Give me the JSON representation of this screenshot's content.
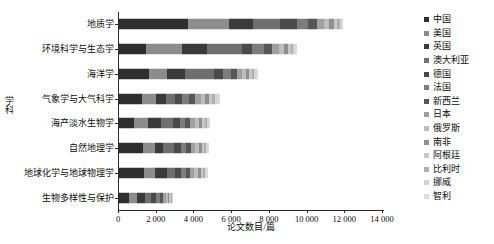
{
  "chart_data": {
    "type": "bar",
    "orientation": "horizontal",
    "stacked": true,
    "title": "",
    "xlabel": "论文数目/篇",
    "ylabel": "学科",
    "xlim": [
      0,
      14000
    ],
    "xticks": [
      0,
      2000,
      4000,
      6000,
      8000,
      10000,
      12000,
      14000
    ],
    "xtick_labels": [
      "0",
      "2 000",
      "4 000",
      "6 000",
      "8 000",
      "10 000",
      "12 000",
      "14 000"
    ],
    "grid": false,
    "legend_position": "right",
    "categories": [
      "地质学",
      "环境科学与生态学",
      "海洋学",
      "气象学与大气科学",
      "海产淡水生物学",
      "自然地理学",
      "地球化学与地球物理学",
      "生物多样性与保护"
    ],
    "series": [
      {
        "name": "中国",
        "color": "#2e2e2e",
        "values": [
          3680,
          1450,
          1580,
          1230,
          800,
          1250,
          1320,
          540
        ]
      },
      {
        "name": "美国",
        "color": "#8c8c8c",
        "values": [
          2150,
          1900,
          970,
          740,
          740,
          640,
          600,
          420
        ]
      },
      {
        "name": "英国",
        "color": "#3a3a3a",
        "values": [
          1260,
          1320,
          930,
          520,
          700,
          430,
          620,
          420
        ]
      },
      {
        "name": "澳大利亚",
        "color": "#6f6f6f",
        "values": [
          1430,
          1880,
          1560,
          460,
          620,
          620,
          430,
          330
        ]
      },
      {
        "name": "德国",
        "color": "#4a4a4a",
        "values": [
          930,
          520,
          480,
          410,
          350,
          330,
          300,
          250
        ]
      },
      {
        "name": "法国",
        "color": "#7d7d7d",
        "values": [
          560,
          610,
          420,
          360,
          300,
          300,
          280,
          210
        ]
      },
      {
        "name": "新西兰",
        "color": "#565656",
        "values": [
          470,
          430,
          300,
          320,
          280,
          250,
          240,
          160
        ]
      },
      {
        "name": "日本",
        "color": "#a0a0a0",
        "values": [
          380,
          360,
          270,
          290,
          250,
          230,
          210,
          140
        ]
      },
      {
        "name": "俄罗斯",
        "color": "#bdbdbd",
        "values": [
          290,
          270,
          230,
          240,
          210,
          190,
          180,
          110
        ]
      },
      {
        "name": "南非",
        "color": "#8f8f8f",
        "values": [
          240,
          210,
          180,
          200,
          170,
          160,
          150,
          90
        ]
      },
      {
        "name": "阿根廷",
        "color": "#c7c7c7",
        "values": [
          180,
          160,
          150,
          180,
          140,
          130,
          120,
          70
        ]
      },
      {
        "name": "比利时",
        "color": "#b0b0b0",
        "values": [
          140,
          130,
          120,
          150,
          120,
          110,
          100,
          60
        ]
      },
      {
        "name": "挪威",
        "color": "#d4d4d4",
        "values": [
          110,
          100,
          100,
          130,
          90,
          90,
          80,
          50
        ]
      },
      {
        "name": "智利",
        "color": "#dcdcdc",
        "values": [
          80,
          80,
          80,
          110,
          80,
          70,
          70,
          40
        ]
      }
    ],
    "category_totals": [
      11900,
      9420,
      7370,
      5340,
      4850,
      4800,
      4700,
      2890
    ]
  },
  "axis": {
    "y_title": "学科",
    "x_title": "论文数目/篇"
  }
}
